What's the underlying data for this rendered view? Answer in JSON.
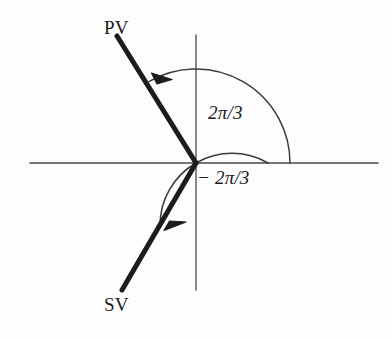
{
  "figure": {
    "type": "phasor-angle-diagram",
    "background_color": "#fdfdfd",
    "ink_color": "#1c1c1c",
    "axis_color": "#555555"
  },
  "labels": {
    "primary_vector": "PV",
    "secondary_vector": "SV",
    "angle_positive": "2π/3",
    "angle_negative": "− 2π/3"
  },
  "geometry": {
    "origin": {
      "x": 196,
      "y": 163
    },
    "horizontal_axis": {
      "x1": 30,
      "y1": 163,
      "x2": 378,
      "y2": 163
    },
    "vertical_axis": {
      "x1": 196,
      "y1": 35,
      "x2": 196,
      "y2": 290
    },
    "vectors": [
      {
        "name": "primary_vector",
        "label": "PV",
        "angle_degrees": 120,
        "angle_radians_label": "2π/3",
        "tip": {
          "x": 117,
          "y": 36
        },
        "stroke_width": 5
      },
      {
        "name": "secondary_vector",
        "label": "SV",
        "angle_degrees": -120,
        "angle_radians_label": "− 2π/3",
        "tip": {
          "x": 122,
          "y": 290
        },
        "stroke_width": 5
      }
    ],
    "arcs": [
      {
        "name": "positive-angle-arc",
        "radius": 94,
        "start_angle_degrees": 0,
        "end_angle_degrees": 120,
        "direction": "counterclockwise",
        "arrow_at": {
          "x": 155,
          "y": 73
        }
      },
      {
        "name": "negative-angle-arc",
        "radius": 72,
        "start_angle_degrees": 0,
        "end_angle_degrees": -120,
        "direction": "clockwise",
        "arrow_at": {
          "x": 170,
          "y": 228
        }
      }
    ]
  }
}
